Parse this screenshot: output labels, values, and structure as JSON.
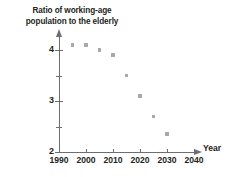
{
  "chart_data": {
    "type": "scatter",
    "title": "Ratio of working-age population to the elderly",
    "title_lines": [
      "Ratio of working-age",
      "population to the elderly"
    ],
    "xlabel": "Year",
    "ylabel": "",
    "x": [
      1995,
      2000,
      2005,
      2010,
      2015,
      2020,
      2025,
      2030
    ],
    "values": [
      4.1,
      4.1,
      4.0,
      3.9,
      3.5,
      3.1,
      2.7,
      2.35
    ],
    "xlim": [
      1990,
      2045
    ],
    "ylim": [
      2,
      4.3
    ],
    "xticks": [
      1990,
      2000,
      2010,
      2020,
      2030,
      2040
    ],
    "xtick_labels": [
      "1990",
      "2000",
      "2010",
      "2020",
      "2030",
      "2040"
    ],
    "yticks": [
      2,
      3,
      4
    ],
    "ytick_labels": [
      "2",
      "3",
      "4"
    ],
    "yticks_minor": [
      2.5,
      3.5
    ],
    "grid": false,
    "legend": null,
    "marker_color": "#a7a9ac",
    "axis_color": "#6d6e71",
    "text_color": "#231f20",
    "background": "#ffffff"
  }
}
